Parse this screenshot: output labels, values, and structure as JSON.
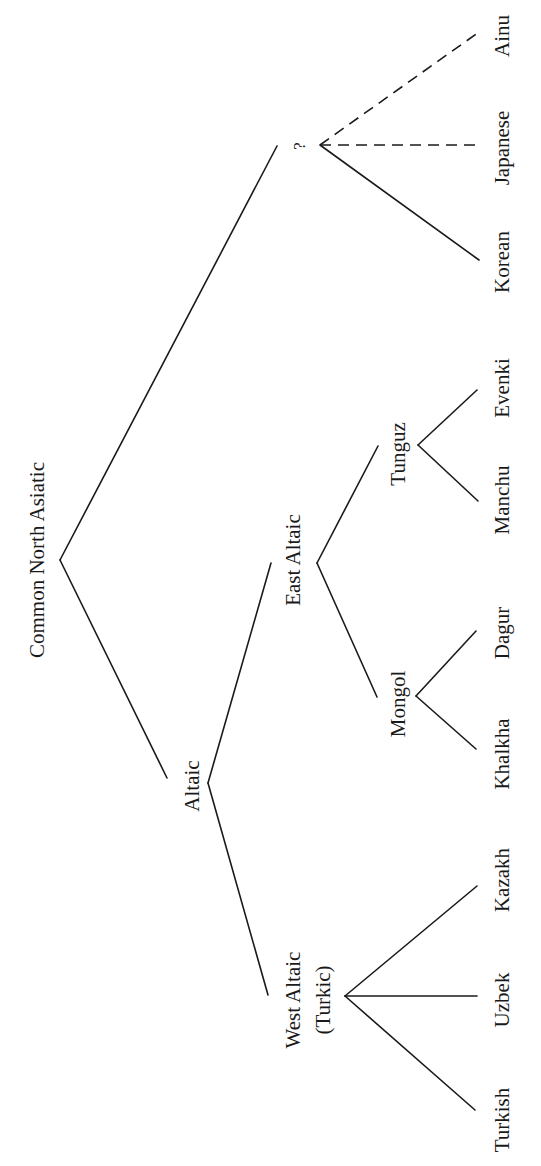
{
  "diagram": {
    "orientation": "rotated 90° clockwise (root on left, leaves on right)",
    "nodes": {
      "root": "Common North Asiatic",
      "altaic": "Altaic",
      "unknown": "?",
      "east_altaic": "East Altaic",
      "west_altaic_line1": "West Altaic",
      "west_altaic_line2": "(Turkic)",
      "tunguz": "Tunguz",
      "mongol": "Mongol"
    },
    "leaves": {
      "ainu": "Ainu",
      "japanese": "Japanese",
      "korean": "Korean",
      "evenki": "Evenki",
      "manchu": "Manchu",
      "dagur": "Dagur",
      "khalkha": "Khalkha",
      "kazakh": "Kazakh",
      "uzbek": "Uzbek",
      "turkish": "Turkish"
    },
    "edge_styles": {
      "solid": "established relationship",
      "dashed": "uncertain relationship (Japanese, Ainu)"
    },
    "tree": {
      "name": "Common North Asiatic",
      "children": [
        {
          "name": "Altaic",
          "children": [
            {
              "name": "West Altaic (Turkic)",
              "children": [
                {
                  "name": "Turkish"
                },
                {
                  "name": "Uzbek"
                },
                {
                  "name": "Kazakh"
                }
              ]
            },
            {
              "name": "East Altaic",
              "children": [
                {
                  "name": "Mongol",
                  "children": [
                    {
                      "name": "Khalkha"
                    },
                    {
                      "name": "Dagur"
                    }
                  ]
                },
                {
                  "name": "Tunguz",
                  "children": [
                    {
                      "name": "Manchu"
                    },
                    {
                      "name": "Evenki"
                    }
                  ]
                }
              ]
            }
          ]
        },
        {
          "name": "?",
          "children": [
            {
              "name": "Korean",
              "edge": "solid"
            },
            {
              "name": "Japanese",
              "edge": "dashed"
            },
            {
              "name": "Ainu",
              "edge": "dashed"
            }
          ]
        }
      ]
    }
  }
}
